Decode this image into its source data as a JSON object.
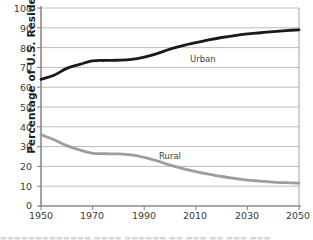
{
  "chart_data": {
    "type": "line",
    "title": "",
    "subtitle": "",
    "xlabel": "",
    "ylabel": "Percentage of U.S. Residents",
    "xlim": [
      1950,
      2050
    ],
    "ylim": [
      0,
      100
    ],
    "grid": "horizontal",
    "legend_position": "inline-annotation",
    "x_ticks": [
      "1950",
      "1970",
      "1990",
      "2010",
      "2030",
      "2050"
    ],
    "y_ticks": [
      "0",
      "10",
      "20",
      "30",
      "40",
      "50",
      "60",
      "70",
      "80",
      "90",
      "100"
    ],
    "x": [
      1950,
      1955,
      1960,
      1965,
      1970,
      1975,
      1980,
      1985,
      1990,
      1995,
      2000,
      2005,
      2010,
      2015,
      2020,
      2025,
      2030,
      2035,
      2040,
      2045,
      2050
    ],
    "series": [
      {
        "name": "Urban",
        "color": "#1a1a1a",
        "values": [
          64,
          66,
          69.5,
          71.5,
          73.3,
          73.5,
          73.6,
          74,
          75.2,
          77,
          79.2,
          81,
          82.5,
          83.9,
          85.1,
          86.1,
          86.9,
          87.5,
          88.1,
          88.6,
          89
        ],
        "label_text": "Urban"
      },
      {
        "name": "Rural",
        "color": "#9d9d9d",
        "values": [
          36,
          33.5,
          30.5,
          28.3,
          26.6,
          26.4,
          26.3,
          25.8,
          24.6,
          22.8,
          20.6,
          18.9,
          17.4,
          16.1,
          14.9,
          13.9,
          13.1,
          12.6,
          12.1,
          11.8,
          11.6
        ],
        "label_text": "Rural"
      }
    ],
    "annotations": [
      {
        "text": "Urban",
        "x": 2003,
        "y": 78
      },
      {
        "text": "Rural",
        "x": 1992,
        "y": 28
      }
    ]
  },
  "axis": {
    "y_title": "Percentage of U.S. Residents",
    "y_ticks": [
      "100",
      "90",
      "80",
      "70",
      "60",
      "50",
      "40",
      "30",
      "20",
      "10",
      "0"
    ],
    "x_ticks": [
      "1950",
      "1970",
      "1990",
      "2010",
      "2030",
      "2050"
    ]
  },
  "labels": {
    "urban": "Urban",
    "rural": "Rural"
  },
  "colors": {
    "urban_line": "#1a1a1a",
    "rural_line": "#9d9d9d",
    "gridline": "#b4b4b4",
    "axis": "#8a8a8a",
    "background": "#ffffff"
  },
  "footer": {
    "cutoff_caption": "▬▬▬▬▬▬▬▬▬▬▬▬▬  ▬▬▬▬  ▬▬▬▬▬▬  ▬▬  ▬▬▬  ▬▬  ▬▬▬  ▬▬▬"
  }
}
